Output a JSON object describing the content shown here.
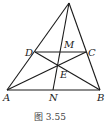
{
  "figure": {
    "caption": "图 3.55",
    "labels": {
      "D": "D",
      "M": "M",
      "C": "C",
      "E": "E",
      "A": "A",
      "N": "N",
      "B": "B"
    },
    "points": {
      "apex": [
        69,
        3
      ],
      "A": [
        7,
        90
      ],
      "B": [
        100,
        90
      ],
      "D": [
        35,
        52
      ],
      "C": [
        86,
        52
      ],
      "M": [
        61,
        52
      ],
      "E": [
        58,
        66
      ],
      "N": [
        53,
        90
      ]
    },
    "segments": [
      [
        "apex",
        "A"
      ],
      [
        "apex",
        "B"
      ],
      [
        "A",
        "B"
      ],
      [
        "D",
        "C"
      ],
      [
        "D",
        "B"
      ],
      [
        "A",
        "C"
      ],
      [
        "apex",
        "N"
      ]
    ]
  }
}
